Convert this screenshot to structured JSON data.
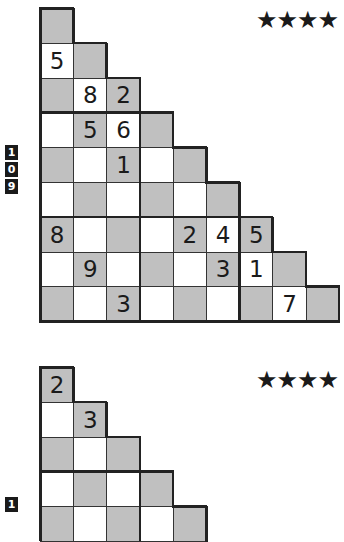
{
  "colors": {
    "shaded": "#c0c0c0",
    "unshaded": "#ffffff",
    "line": "#333333",
    "star": "#1a1a1a"
  },
  "puzzles": [
    {
      "id_digits": [
        "1",
        "0",
        "9"
      ],
      "difficulty": "★★★★",
      "rows": [
        [
          ""
        ],
        [
          "5",
          ""
        ],
        [
          "",
          "8",
          "2"
        ],
        [
          "",
          "5",
          "6",
          ""
        ],
        [
          "",
          "",
          "1",
          "",
          ""
        ],
        [
          "",
          "",
          "",
          "",
          "",
          ""
        ],
        [
          "8",
          "",
          "",
          "",
          "2",
          "4",
          "5"
        ],
        [
          "",
          "9",
          "",
          "",
          "",
          "3",
          "1",
          ""
        ],
        [
          "",
          "",
          "3",
          "",
          "",
          "",
          "",
          "7",
          ""
        ]
      ]
    },
    {
      "id_digits": [
        "1"
      ],
      "difficulty": "★★★★",
      "rows": [
        [
          "2"
        ],
        [
          "",
          "3"
        ],
        [
          "",
          "",
          ""
        ],
        [
          "",
          "",
          "",
          ""
        ],
        [
          "",
          "",
          "",
          "",
          ""
        ]
      ]
    }
  ]
}
